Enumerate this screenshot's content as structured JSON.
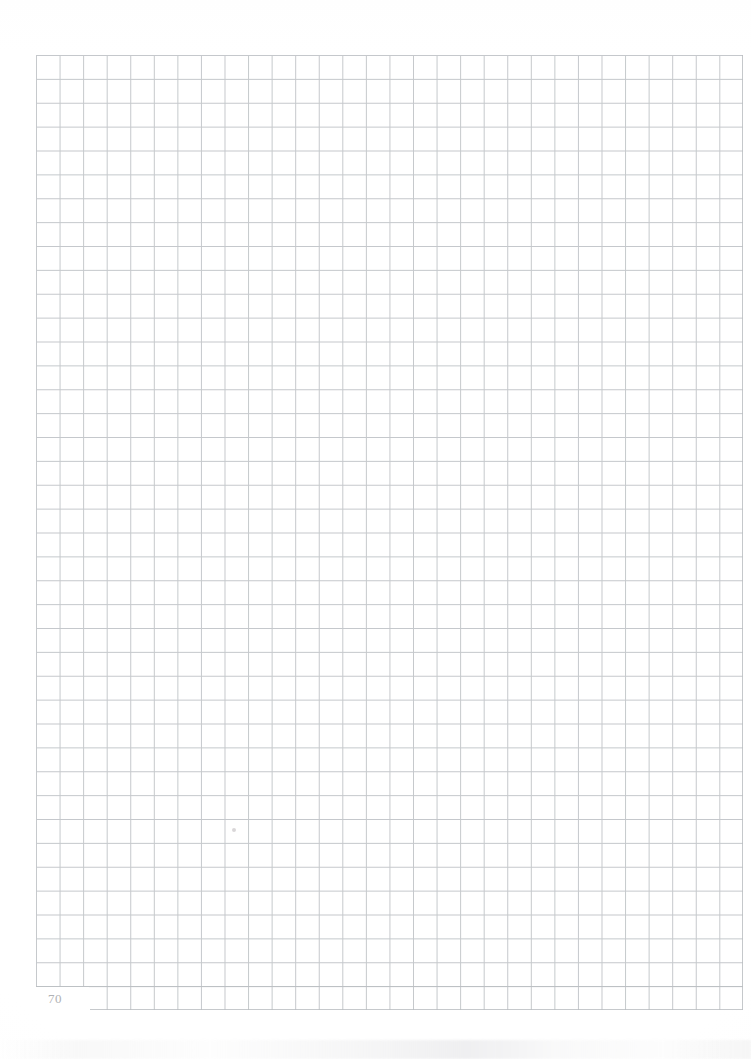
{
  "document": {
    "type": "scanned-notebook-page",
    "paper_style": "graph-paper",
    "page_number": "70",
    "content_text": "",
    "background_color": "#ffffff",
    "rule_color": "#b9bdc1",
    "page_number_color": "#b0b2b4"
  },
  "grid": {
    "columns": 30,
    "rows": 40,
    "cell_width_px": 23.57,
    "cell_height_px": 23.88,
    "origin_x_px": 36,
    "origin_y_px": 55,
    "width_px": 707,
    "height_px": 955,
    "last_row_notched": true,
    "notch_label": "page-number-gutter"
  },
  "artifacts": {
    "pencil_mark_label": "faint pencil dot",
    "scan_noise_label": "scanner edge noise"
  }
}
